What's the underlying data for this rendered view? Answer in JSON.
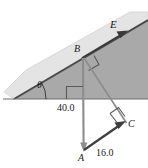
{
  "figure": {
    "type": "physics-diagram-inclined-plane",
    "labels": {
      "vector_E": "E",
      "point_B": "B",
      "point_C": "C",
      "point_A": "A",
      "angle_theta": "θ",
      "length_vertical": "40.0",
      "length_base": "16.0"
    },
    "colors": {
      "incline_front_face": "#a8a8a8",
      "incline_top_face": "#e2e2e2",
      "incline_edge": "#555555",
      "line_stroke": "#7a7a7a",
      "text": "#1a1a1a",
      "background": "#ffffff"
    },
    "geometry": {
      "ground_line_y": 99,
      "incline_apex": [
        138,
        22
      ],
      "incline_foot": [
        14,
        99
      ],
      "point_B": [
        82,
        58
      ],
      "point_A": [
        84,
        152
      ],
      "point_C": [
        126,
        124
      ],
      "angle_theta_deg": 32
    }
  }
}
